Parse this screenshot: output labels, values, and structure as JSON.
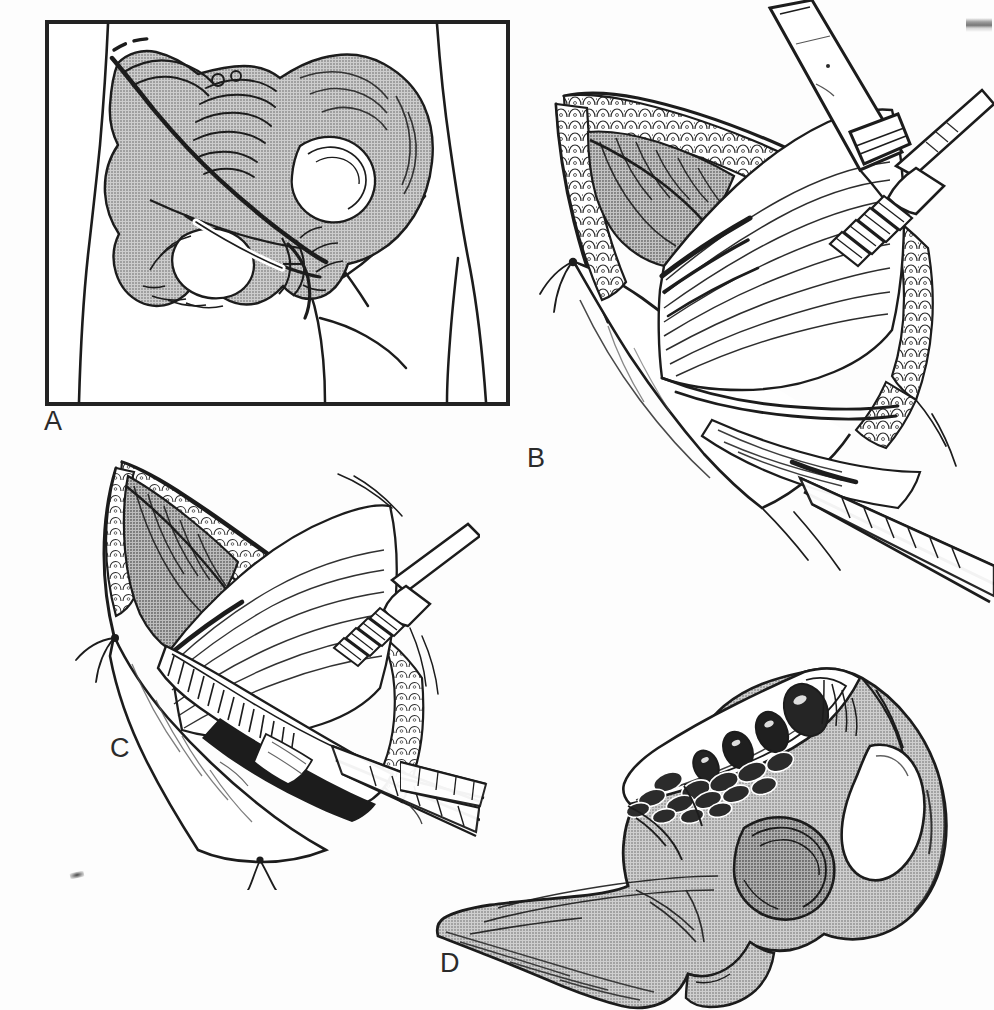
{
  "figure": {
    "panel_count": 4,
    "background_color": "#fdfdfd",
    "ink_color": "#1c1c1c",
    "bone_shade_color": "#b4b4b4",
    "muscle_shade_color": "#9a9a9a",
    "style": "black-and-white pen-and-ink medical line drawing with halftone gray shading"
  },
  "panels": [
    {
      "id": "A",
      "label": "A",
      "label_x": 44,
      "label_y": 408,
      "caption": "Surface anatomy of the hemipelvis with the planned skin incision over the anterior iliac crest",
      "framed": true,
      "frame": {
        "x": 47,
        "y": 22,
        "width": 461,
        "height": 382
      },
      "contents": [
        "torso-outline",
        "hemipelvis-bone",
        "iliac-crest",
        "anterior-superior-iliac-spine",
        "sacrum",
        "acetabulum",
        "obturator-foramen",
        "pubic-symphysis",
        "incision-line",
        "dashed-incision-extension",
        "inguinal-ligament",
        "thigh-outline"
      ]
    },
    {
      "id": "B",
      "label": "B",
      "label_x": 527,
      "label_y": 445,
      "caption": "Subcutaneous tissue retracted; external oblique aponeurosis and gluteal musculature exposed along the crest",
      "framed": false,
      "contents": [
        "skin-flap",
        "subcutaneous-fat-layer",
        "external-oblique-muscle",
        "gluteus-medius-muscle",
        "iliac-crest-ridge",
        "army-navy-retractor",
        "rake-retractor",
        "forceps",
        "retention-suture"
      ]
    },
    {
      "id": "C",
      "label": "C",
      "label_x": 110,
      "label_y": 735,
      "caption": "Deeper dissection along the crest; muscle elevated subperiosteally to expose the inner table",
      "framed": false,
      "contents": [
        "skin-flap",
        "subcutaneous-fat-layer",
        "abdominal-muscle-layer",
        "elevated-periosteum",
        "exposed-iliac-crest",
        "rake-retractor",
        "forceps",
        "retention-suture"
      ]
    },
    {
      "id": "D",
      "label": "D",
      "label_x": 440,
      "label_y": 965,
      "caption": "Hemipelvis after tricortical graft removal, showing the cancellous donor defect in the iliac crest",
      "framed": false,
      "contents": [
        "hemipelvis-bone",
        "iliac-crest-donor-defect",
        "cancellous-bone-trabeculae",
        "acetabulum",
        "obturator-foramen",
        "ischial-tuberosity",
        "forceps-tip"
      ]
    }
  ],
  "artifacts": [
    {
      "name": "scan-edge-fragment",
      "position": "top-right",
      "x": 966,
      "y": 18
    },
    {
      "name": "dust-speck",
      "position": "lower-left",
      "x": 70,
      "y": 872
    }
  ]
}
